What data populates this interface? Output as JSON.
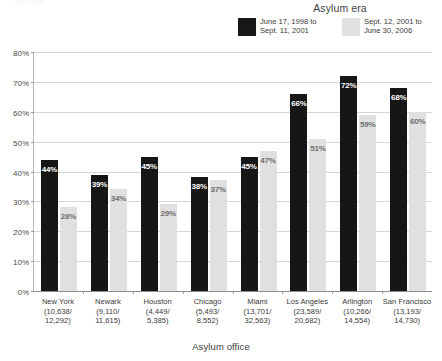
{
  "clipped_top_text": "30, 2006",
  "legend": {
    "title": "Asylum era",
    "items": [
      {
        "label_line1": "June 17, 1998 to",
        "label_line2": "Sept. 11, 2001",
        "color": "#171717",
        "swatch": "dark-swatch"
      },
      {
        "label_line1": "Sept. 12, 2001 to",
        "label_line2": "June 30, 2006",
        "color": "#e2e2e2",
        "swatch": "light-swatch"
      }
    ]
  },
  "axes": {
    "xlabel": "Asylum office",
    "ylabel": "",
    "yticks": [
      "0%",
      "10%",
      "20%",
      "30%",
      "40%",
      "50%",
      "60%",
      "70%",
      "80%"
    ]
  },
  "chart_data": {
    "type": "bar",
    "title": "",
    "xlabel": "Asylum office",
    "ylabel": "",
    "ylim": [
      0,
      80
    ],
    "ytick_values": [
      0,
      10,
      20,
      30,
      40,
      50,
      60,
      70,
      80
    ],
    "ytick_labels": [
      "0%",
      "10%",
      "20%",
      "30%",
      "40%",
      "50%",
      "60%",
      "70%",
      "80%"
    ],
    "grid": true,
    "legend_position": "top-right",
    "legend_title": "Asylum era",
    "categories": [
      "New York\n(10,638/\n12,292)",
      "Newark\n(9,110/\n11,615)",
      "Houston\n(4,449/\n5,385)",
      "Chicago\n(5,493/\n8,552)",
      "Miami\n(13,701/\n32,563)",
      "Los Angeles\n(23,589/\n20,682)",
      "Arlington\n(10,266/\n14,554)",
      "San Francisco\n(13,193/\n14,730)"
    ],
    "category_details": [
      {
        "name": "New York",
        "count_era1": "10,638",
        "count_era2": "12,292"
      },
      {
        "name": "Newark",
        "count_era1": "9,110",
        "count_era2": "11,615"
      },
      {
        "name": "Houston",
        "count_era1": "4,449",
        "count_era2": "5,385"
      },
      {
        "name": "Chicago",
        "count_era1": "5,493",
        "count_era2": "8,552"
      },
      {
        "name": "Miami",
        "count_era1": "13,701",
        "count_era2": "32,563"
      },
      {
        "name": "Los Angeles",
        "count_era1": "23,589",
        "count_era2": "20,682"
      },
      {
        "name": "Arlington",
        "count_era1": "10,266",
        "count_era2": "14,554"
      },
      {
        "name": "San Francisco",
        "count_era1": "13,193",
        "count_era2": "14,730"
      }
    ],
    "series": [
      {
        "name": "June 17, 1998 to Sept. 11, 2001",
        "color": "#161616",
        "values": [
          44,
          39,
          45,
          38,
          45,
          66,
          72,
          68
        ],
        "labels": [
          "44%",
          "39%",
          "45%",
          "38%",
          "45%",
          "66%",
          "72%",
          "68%"
        ]
      },
      {
        "name": "Sept. 12, 2001 to June 30, 2006",
        "color": "#e0e0e0",
        "values": [
          28,
          34,
          29,
          37,
          47,
          51,
          59,
          60
        ],
        "labels": [
          "28%",
          "34%",
          "29%",
          "37%",
          "47%",
          "51%",
          "59%",
          "60%"
        ]
      }
    ]
  }
}
